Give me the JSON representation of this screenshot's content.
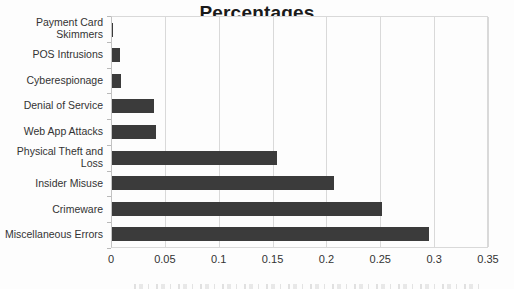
{
  "chart_data": {
    "type": "bar",
    "orientation": "horizontal",
    "title": "Percentages",
    "categories": [
      "Payment Card Skimmers",
      "POS Intrusions",
      "Cyberespionage",
      "Denial of Service",
      "Web App Attacks",
      "Physical Theft and Loss",
      "Insider Misuse",
      "Crimeware",
      "Miscellaneous Errors"
    ],
    "values": [
      0.001,
      0.007,
      0.008,
      0.039,
      0.041,
      0.153,
      0.206,
      0.251,
      0.294
    ],
    "xlabel": "",
    "ylabel": "",
    "xlim": [
      0,
      0.35
    ],
    "xticks": [
      0,
      0.05,
      0.1,
      0.15,
      0.2,
      0.25,
      0.3,
      0.35
    ],
    "xtick_labels": [
      "0",
      "0.05",
      "0.1",
      "0.15",
      "0.2",
      "0.25",
      "0.3",
      "0.35"
    ],
    "grid": true,
    "legend": false,
    "bar_color": "#3b3b3b",
    "gridline_color": "#d9d9d9",
    "text_color": "#333333"
  }
}
